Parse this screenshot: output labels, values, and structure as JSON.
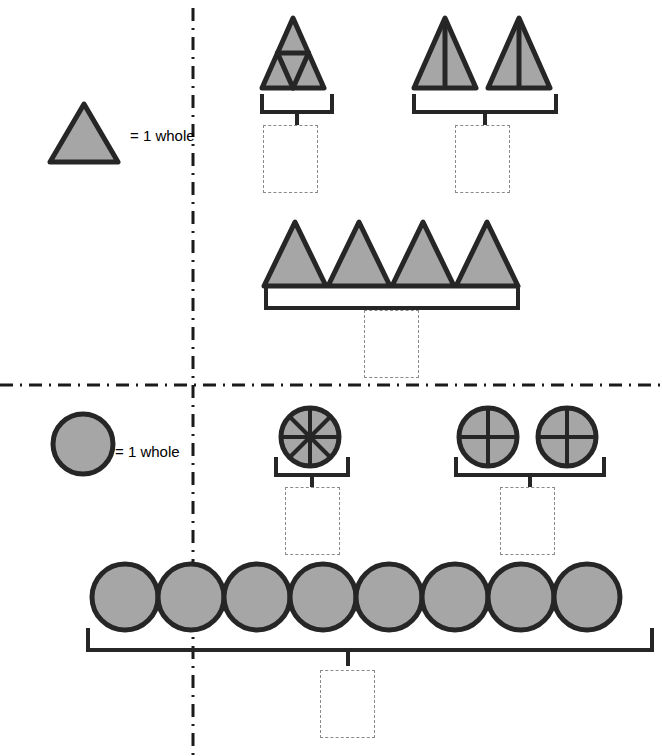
{
  "page": {
    "background_color": "#ffffff"
  },
  "style": {
    "shape_fill": "#A6A6A6",
    "shape_stroke": "#262626",
    "divider_color": "#1a1a1a",
    "brace_color": "#262626",
    "answer_box_border": "#8a8a8a"
  },
  "dividers": {
    "vertical": {
      "label": "vertical-dash-dot-divider",
      "x": 193,
      "y1": 8,
      "y2": 756
    },
    "horizontal": {
      "label": "horizontal-dash-dot-divider",
      "y": 385,
      "x1": 0,
      "x2": 662
    }
  },
  "legends": [
    {
      "id": "triangle-legend",
      "shape": "triangle",
      "text": "= 1 whole",
      "x": 50,
      "y": 105,
      "width": 72,
      "height": 60
    },
    {
      "id": "circle-legend",
      "shape": "circle",
      "text": "= 1 whole",
      "x": 52,
      "y": 413,
      "diameter": 58
    }
  ],
  "sections": [
    {
      "id": "triangles-section",
      "shape": "triangle",
      "groups": [
        {
          "id": "triangle-group-fourths",
          "shape": "triangle",
          "count": 1,
          "partitions": 4,
          "partition_style": "triangle-fourths",
          "answer": "",
          "answer_placeholder": ""
        },
        {
          "id": "triangle-group-halves",
          "shape": "triangle",
          "count": 2,
          "partitions": 2,
          "partition_style": "vertical-half",
          "answer": "",
          "answer_placeholder": ""
        },
        {
          "id": "triangle-group-wholes",
          "shape": "triangle",
          "count": 4,
          "partitions": 1,
          "partition_style": "whole",
          "answer": "",
          "answer_placeholder": ""
        }
      ]
    },
    {
      "id": "circles-section",
      "shape": "circle",
      "groups": [
        {
          "id": "circle-group-eighths",
          "shape": "circle",
          "count": 1,
          "partitions": 8,
          "partition_style": "eighths",
          "answer": "",
          "answer_placeholder": ""
        },
        {
          "id": "circle-group-fourths",
          "shape": "circle",
          "count": 2,
          "partitions": 4,
          "partition_style": "quarters",
          "answer": "",
          "answer_placeholder": ""
        },
        {
          "id": "circle-group-wholes",
          "shape": "circle",
          "count": 8,
          "partitions": 1,
          "partition_style": "whole",
          "answer": "",
          "answer_placeholder": ""
        }
      ]
    }
  ],
  "answer_boxes": [
    {
      "id": "answer-box-1",
      "group": "triangle-group-fourths",
      "value": "",
      "x": 263,
      "y": 125,
      "width": 55,
      "height": 68
    },
    {
      "id": "answer-box-2",
      "group": "triangle-group-halves",
      "value": "",
      "x": 455,
      "y": 125,
      "width": 55,
      "height": 68
    },
    {
      "id": "answer-box-3",
      "group": "triangle-group-wholes",
      "value": "",
      "x": 364,
      "y": 310,
      "width": 55,
      "height": 68
    },
    {
      "id": "answer-box-4",
      "group": "circle-group-eighths",
      "value": "",
      "x": 285,
      "y": 487,
      "width": 55,
      "height": 68
    },
    {
      "id": "answer-box-5",
      "group": "circle-group-fourths",
      "value": "",
      "x": 500,
      "y": 487,
      "width": 55,
      "height": 68
    },
    {
      "id": "answer-box-6",
      "group": "circle-group-wholes",
      "value": "",
      "x": 320,
      "y": 670,
      "width": 55,
      "height": 68
    }
  ]
}
